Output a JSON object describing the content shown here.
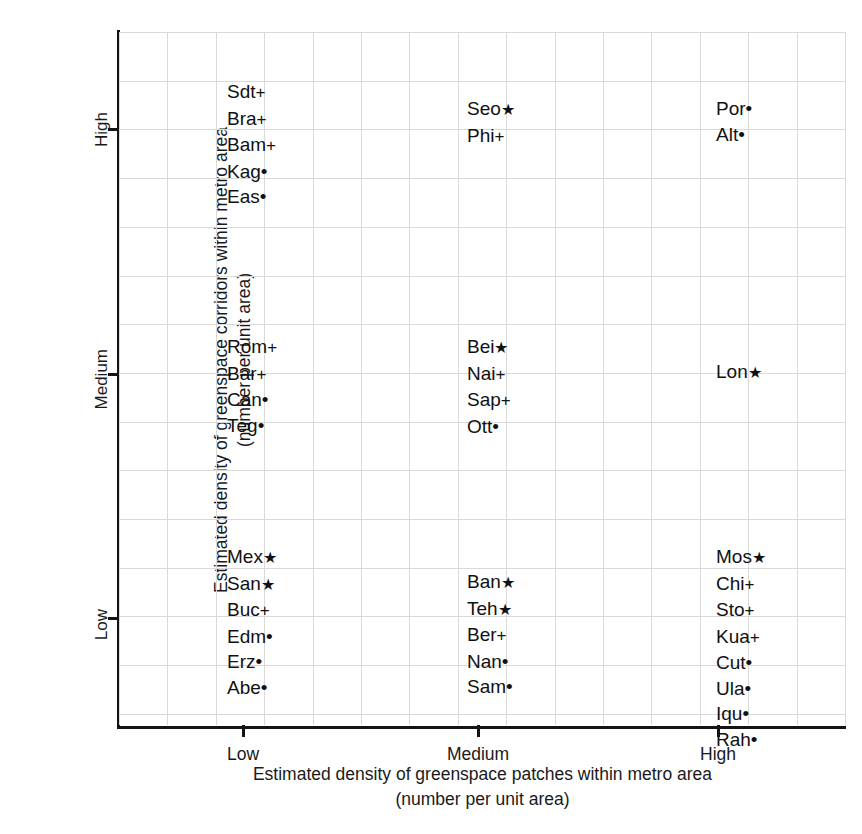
{
  "chart_data": {
    "type": "scatter",
    "title": "",
    "xlabel": "Estimated density of greenspace patches within metro area (number per unit area)",
    "ylabel": "Estimated density of greenspace corridors within metro area (number per unit area)",
    "xlabel_line1": "Estimated density of greenspace patches within metro area",
    "xlabel_line2": "(number per unit area)",
    "ylabel_line1": "Estimated density of greenspace corridors within metro area",
    "ylabel_line2": "(number per unit area)",
    "grid": true,
    "legend": "none",
    "x_categories": [
      "Low",
      "Medium",
      "High"
    ],
    "y_categories": [
      "Low",
      "Medium",
      "High"
    ],
    "xticklabels": [
      "Low",
      "Medium",
      "High"
    ],
    "yticklabels": [
      "Low",
      "Medium",
      "High"
    ],
    "markers": {
      "star": "★",
      "plus": "+",
      "dot": "•"
    },
    "points": [
      {
        "label": "Sdt",
        "marker": "plus",
        "x": "Low",
        "y": "High"
      },
      {
        "label": "Bra",
        "marker": "plus",
        "x": "Low",
        "y": "High"
      },
      {
        "label": "Bam",
        "marker": "plus",
        "x": "Low",
        "y": "High"
      },
      {
        "label": "Kag",
        "marker": "dot",
        "x": "Low",
        "y": "High"
      },
      {
        "label": "Eas",
        "marker": "dot",
        "x": "Low",
        "y": "High"
      },
      {
        "label": "Seo",
        "marker": "star",
        "x": "Medium",
        "y": "High"
      },
      {
        "label": "Phi",
        "marker": "plus",
        "x": "Medium",
        "y": "High"
      },
      {
        "label": "Por",
        "marker": "dot",
        "x": "High",
        "y": "High"
      },
      {
        "label": "Alt",
        "marker": "dot",
        "x": "High",
        "y": "High"
      },
      {
        "label": "Rom",
        "marker": "plus",
        "x": "Low",
        "y": "Medium"
      },
      {
        "label": "Bar",
        "marker": "plus",
        "x": "Low",
        "y": "Medium"
      },
      {
        "label": "Can",
        "marker": "dot",
        "x": "Low",
        "y": "Medium"
      },
      {
        "label": "Teg",
        "marker": "dot",
        "x": "Low",
        "y": "Medium"
      },
      {
        "label": "Bei",
        "marker": "star",
        "x": "Medium",
        "y": "Medium"
      },
      {
        "label": "Nai",
        "marker": "plus",
        "x": "Medium",
        "y": "Medium"
      },
      {
        "label": "Sap",
        "marker": "plus",
        "x": "Medium",
        "y": "Medium"
      },
      {
        "label": "Ott",
        "marker": "dot",
        "x": "Medium",
        "y": "Medium"
      },
      {
        "label": "Lon",
        "marker": "star",
        "x": "High",
        "y": "Medium"
      },
      {
        "label": "Mex",
        "marker": "star",
        "x": "Low",
        "y": "Low"
      },
      {
        "label": "San",
        "marker": "star",
        "x": "Low",
        "y": "Low"
      },
      {
        "label": "Buc",
        "marker": "plus",
        "x": "Low",
        "y": "Low"
      },
      {
        "label": "Edm",
        "marker": "dot",
        "x": "Low",
        "y": "Low"
      },
      {
        "label": "Erz",
        "marker": "dot",
        "x": "Low",
        "y": "Low"
      },
      {
        "label": "Abe",
        "marker": "dot",
        "x": "Low",
        "y": "Low"
      },
      {
        "label": "Ban",
        "marker": "star",
        "x": "Medium",
        "y": "Low"
      },
      {
        "label": "Teh",
        "marker": "star",
        "x": "Medium",
        "y": "Low"
      },
      {
        "label": "Ber",
        "marker": "plus",
        "x": "Medium",
        "y": "Low"
      },
      {
        "label": "Nan",
        "marker": "dot",
        "x": "Medium",
        "y": "Low"
      },
      {
        "label": "Sam",
        "marker": "dot",
        "x": "Medium",
        "y": "Low"
      },
      {
        "label": "Mos",
        "marker": "star",
        "x": "High",
        "y": "Low"
      },
      {
        "label": "Chi",
        "marker": "plus",
        "x": "High",
        "y": "Low"
      },
      {
        "label": "Sto",
        "marker": "plus",
        "x": "High",
        "y": "Low"
      },
      {
        "label": "Kua",
        "marker": "plus",
        "x": "High",
        "y": "Low"
      },
      {
        "label": "Cut",
        "marker": "dot",
        "x": "High",
        "y": "Low"
      },
      {
        "label": "Ula",
        "marker": "dot",
        "x": "High",
        "y": "Low"
      },
      {
        "label": "Iqu",
        "marker": "dot",
        "x": "High",
        "y": "Low"
      },
      {
        "label": "Rah",
        "marker": "dot",
        "x": "High",
        "y": "Low"
      }
    ],
    "clusters": [
      {
        "key": "low-high",
        "x": "Low",
        "y": "High",
        "left": 108,
        "top": 47,
        "labels": [
          "Sdt",
          "Bra",
          "Bam",
          "Kag",
          "Eas"
        ]
      },
      {
        "key": "medium-high",
        "x": "Medium",
        "y": "High",
        "left": 348,
        "top": 64,
        "labels": [
          "Seo",
          "Phi"
        ]
      },
      {
        "key": "high-high",
        "x": "High",
        "y": "High",
        "left": 597,
        "top": 64,
        "labels": [
          "Por",
          "Alt"
        ]
      },
      {
        "key": "low-medium",
        "x": "Low",
        "y": "Medium",
        "left": 108,
        "top": 302,
        "labels": [
          "Rom",
          "Bar",
          "Can",
          "Teg"
        ]
      },
      {
        "key": "medium-medium",
        "x": "Medium",
        "y": "Medium",
        "left": 348,
        "top": 302,
        "labels": [
          "Bei",
          "Nai",
          "Sap",
          "Ott"
        ]
      },
      {
        "key": "high-medium",
        "x": "High",
        "y": "Medium",
        "left": 597,
        "top": 327,
        "labels": [
          "Lon"
        ]
      },
      {
        "key": "low-low",
        "x": "Low",
        "y": "Low",
        "left": 108,
        "top": 512,
        "labels": [
          "Mex",
          "San",
          "Buc",
          "Edm",
          "Erz",
          "Abe"
        ]
      },
      {
        "key": "medium-low",
        "x": "Medium",
        "y": "Low",
        "left": 348,
        "top": 537,
        "labels": [
          "Ban",
          "Teh",
          "Ber",
          "Nan",
          "Sam"
        ]
      },
      {
        "key": "high-low",
        "x": "High",
        "y": "Low",
        "left": 597,
        "top": 512,
        "labels": [
          "Mos",
          "Chi",
          "Sto",
          "Kua",
          "Cut",
          "Ula",
          "Iqu",
          "Rah"
        ]
      }
    ],
    "ytick_positions": [
      617,
      373,
      128
    ],
    "xtick_positions": [
      124,
      359,
      599
    ]
  }
}
